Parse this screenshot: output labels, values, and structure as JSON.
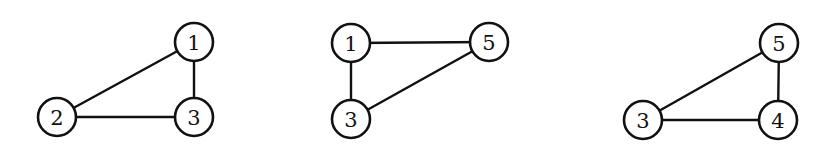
{
  "diagram": {
    "node_radius": 19,
    "stroke_color": "#111111",
    "background": "#ffffff",
    "graphs": [
      {
        "id": "graph-a",
        "nodes": [
          {
            "label": "1",
            "x": 194,
            "y": 42
          },
          {
            "label": "2",
            "x": 57,
            "y": 117
          },
          {
            "label": "3",
            "x": 194,
            "y": 117
          }
        ],
        "edges": [
          [
            "1",
            "2"
          ],
          [
            "1",
            "3"
          ],
          [
            "2",
            "3"
          ]
        ]
      },
      {
        "id": "graph-b",
        "nodes": [
          {
            "label": "1",
            "x": 351,
            "y": 43
          },
          {
            "label": "5",
            "x": 489,
            "y": 42
          },
          {
            "label": "3",
            "x": 351,
            "y": 119
          }
        ],
        "edges": [
          [
            "1",
            "5"
          ],
          [
            "1",
            "3"
          ],
          [
            "3",
            "5"
          ]
        ]
      },
      {
        "id": "graph-c",
        "nodes": [
          {
            "label": "5",
            "x": 779,
            "y": 43
          },
          {
            "label": "3",
            "x": 643,
            "y": 120
          },
          {
            "label": "4",
            "x": 778,
            "y": 120
          }
        ],
        "edges": [
          [
            "5",
            "3"
          ],
          [
            "5",
            "4"
          ],
          [
            "3",
            "4"
          ]
        ]
      }
    ]
  }
}
